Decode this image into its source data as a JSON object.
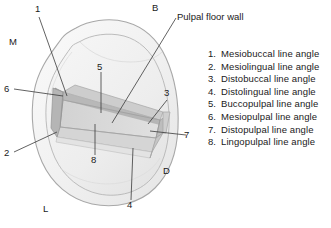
{
  "figure": {
    "title_annotation": "Pulpal floor wall",
    "orientation_labels": [
      {
        "id": "buccal",
        "text": "B",
        "x": 154,
        "y": 6
      },
      {
        "id": "mesial",
        "text": "M",
        "x": 10,
        "y": 40
      },
      {
        "id": "distal",
        "text": "D",
        "x": 164,
        "y": 169
      },
      {
        "id": "lingual",
        "text": "L",
        "x": 44,
        "y": 207
      }
    ],
    "callouts": [
      {
        "num": "1",
        "x": 35,
        "y": 7
      },
      {
        "num": "2",
        "x": 5,
        "y": 150
      },
      {
        "num": "3",
        "x": 165,
        "y": 90
      },
      {
        "num": "4",
        "x": 127,
        "y": 202
      },
      {
        "num": "5",
        "x": 98,
        "y": 64
      },
      {
        "num": "6",
        "x": 5,
        "y": 86
      },
      {
        "num": "7",
        "x": 184,
        "y": 132
      },
      {
        "num": "8",
        "x": 91,
        "y": 157
      }
    ],
    "colors": {
      "outline": "#9a9a9a",
      "enamel_fill": "#f2f2f2",
      "crown_fill": "#ececec",
      "cavity_wall_dark": "#a8a8a8",
      "cavity_wall_mid": "#c4c4c4",
      "cavity_floor": "#d9d9d9",
      "leader_line": "#333333",
      "text": "#1a1a1a"
    }
  },
  "legend": {
    "items": [
      {
        "num": "1.",
        "label": "Mesiobuccal line angle"
      },
      {
        "num": "2.",
        "label": "Mesiolingual line angle"
      },
      {
        "num": "3.",
        "label": "Distobuccal line angle"
      },
      {
        "num": "4.",
        "label": "Distolingual line angle"
      },
      {
        "num": "5.",
        "label": "Buccopulpal line angle"
      },
      {
        "num": "6.",
        "label": "Mesiopulpal line angle"
      },
      {
        "num": "7.",
        "label": "Distopulpal line angle"
      },
      {
        "num": "8.",
        "label": "Lingopulpal line angle"
      }
    ]
  }
}
